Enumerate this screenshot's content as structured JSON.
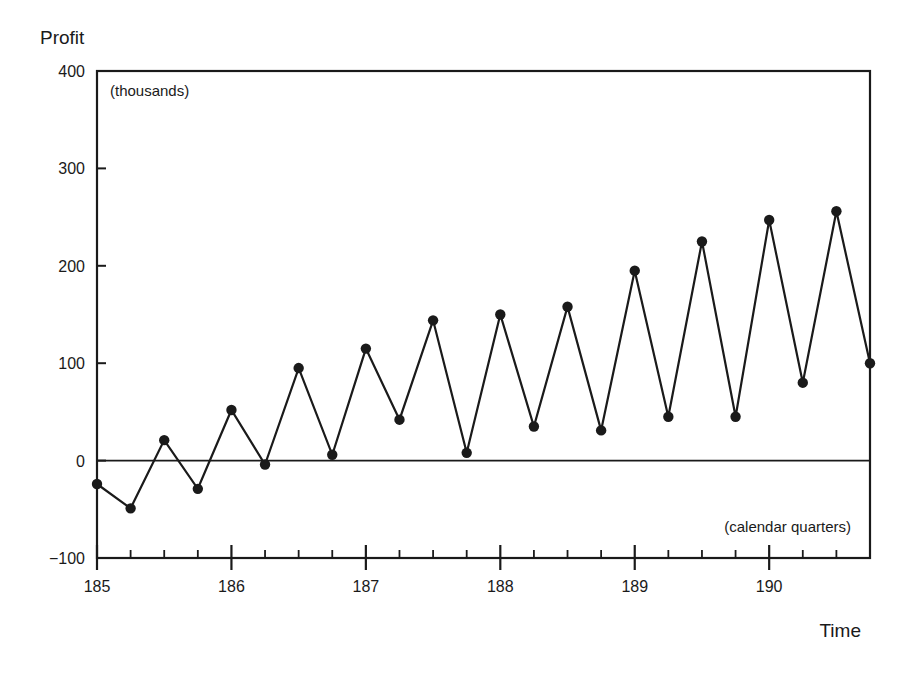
{
  "chart_data": {
    "type": "line",
    "title": "",
    "ylabel": "Profit",
    "ylabel_units": "(thousands)",
    "xlabel": "Time",
    "xlabel_units": "(calendar quarters)",
    "ylim": [
      -100,
      400
    ],
    "xlim": [
      185,
      190.75
    ],
    "yticks": [
      -100,
      0,
      100,
      200,
      300,
      400
    ],
    "ytick_labels": [
      "−100",
      "0",
      "100",
      "200",
      "300",
      "400"
    ],
    "xticks": [
      185,
      186,
      187,
      188,
      189,
      190
    ],
    "xtick_labels": [
      "185",
      "186",
      "187",
      "188",
      "189",
      "190"
    ],
    "minor_xticks_per_year": 4,
    "grid": false,
    "reference_line": 0,
    "markers": true,
    "series": [
      {
        "name": "Profit",
        "x": [
          185.0,
          185.25,
          185.5,
          185.75,
          186.0,
          186.25,
          186.5,
          186.75,
          187.0,
          187.25,
          187.5,
          187.75,
          188.0,
          188.25,
          188.5,
          188.75,
          189.0,
          189.25,
          189.5,
          189.75,
          190.0,
          190.25,
          190.5,
          190.75
        ],
        "values": [
          -24,
          -49,
          21,
          -29,
          52,
          -4,
          95,
          6,
          115,
          42,
          144,
          8,
          150,
          35,
          158,
          31,
          195,
          45,
          225,
          45,
          247,
          80,
          256,
          100
        ]
      }
    ]
  },
  "colors": {
    "line": "#1a1a1a",
    "marker": "#1a1a1a",
    "axis": "#1a1a1a",
    "background": "#ffffff"
  }
}
